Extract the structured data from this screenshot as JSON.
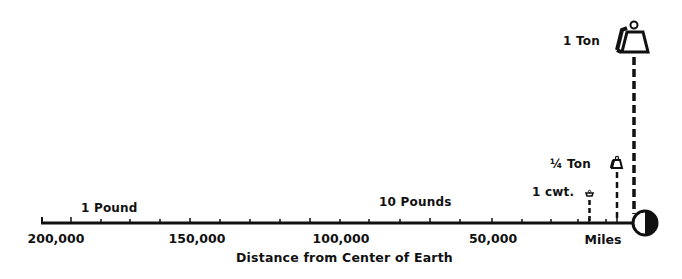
{
  "diagram": {
    "axis": {
      "title": "Distance from Center of Earth",
      "unit_label": "Miles",
      "ticks": [
        {
          "label": "200,000",
          "value": 200000
        },
        {
          "label": "150,000",
          "value": 150000
        },
        {
          "label": "100,000",
          "value": 100000
        },
        {
          "label": "50,000",
          "value": 50000
        }
      ],
      "range": [
        0,
        200000
      ],
      "direction": "decreasing-left-to-right"
    },
    "weights": [
      {
        "label": "1 Pound",
        "distance_approx_miles": 180000,
        "marker": "none"
      },
      {
        "label": "10 Pounds",
        "distance_approx_miles": 70000,
        "marker": "none"
      },
      {
        "label": "1 cwt.",
        "distance_approx_miles": 18000,
        "marker": "small-weight-icon"
      },
      {
        "label": "¼ Ton",
        "distance_approx_miles": 8000,
        "marker": "medium-weight-icon"
      },
      {
        "label": "1 Ton",
        "distance_approx_miles": 4000,
        "marker": "large-weight-icon"
      }
    ],
    "earth_symbol": "half-shaded-circle-icon",
    "colors": {
      "ink": "#111111",
      "background": "#ffffff"
    }
  }
}
